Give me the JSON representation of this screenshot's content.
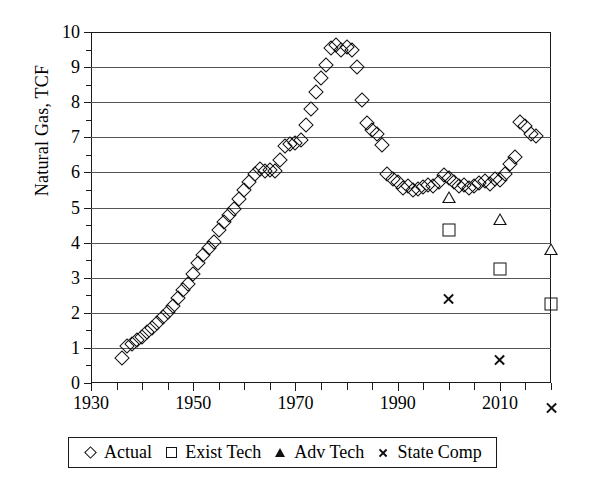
{
  "chart_data": {
    "type": "scatter",
    "title": "",
    "xlabel": "",
    "ylabel": "Natural Gas, TCF",
    "xlim": [
      1930,
      2020
    ],
    "ylim": [
      0,
      10
    ],
    "grid": true,
    "x_tick_step": 5,
    "x_label_step": 20,
    "y_tick_step": 0.5,
    "y_label_step": 1,
    "x_ticklabels": [
      "1930",
      "1950",
      "1970",
      "1990",
      "2010"
    ],
    "y_ticklabels": [
      "0",
      "1",
      "2",
      "3",
      "4",
      "5",
      "6",
      "7",
      "8",
      "9",
      "10"
    ],
    "legend_position": "below-axes",
    "series": [
      {
        "name": "Actual",
        "marker": "diamond",
        "points": [
          [
            1936,
            0.72
          ],
          [
            1937,
            1.05
          ],
          [
            1938,
            1.12
          ],
          [
            1939,
            1.22
          ],
          [
            1940,
            1.3
          ],
          [
            1941,
            1.45
          ],
          [
            1942,
            1.58
          ],
          [
            1943,
            1.72
          ],
          [
            1944,
            1.88
          ],
          [
            1945,
            2.02
          ],
          [
            1946,
            2.18
          ],
          [
            1947,
            2.42
          ],
          [
            1948,
            2.65
          ],
          [
            1949,
            2.82
          ],
          [
            1950,
            3.1
          ],
          [
            1951,
            3.42
          ],
          [
            1952,
            3.65
          ],
          [
            1953,
            3.85
          ],
          [
            1954,
            4.02
          ],
          [
            1955,
            4.35
          ],
          [
            1956,
            4.6
          ],
          [
            1957,
            4.78
          ],
          [
            1958,
            4.95
          ],
          [
            1959,
            5.25
          ],
          [
            1960,
            5.5
          ],
          [
            1961,
            5.72
          ],
          [
            1962,
            5.95
          ],
          [
            1963,
            6.1
          ],
          [
            1964,
            6.05
          ],
          [
            1965,
            6.08
          ],
          [
            1966,
            6.05
          ],
          [
            1967,
            6.35
          ],
          [
            1968,
            6.75
          ],
          [
            1969,
            6.8
          ],
          [
            1970,
            6.85
          ],
          [
            1971,
            6.92
          ],
          [
            1972,
            7.35
          ],
          [
            1973,
            7.8
          ],
          [
            1974,
            8.3
          ],
          [
            1975,
            8.7
          ],
          [
            1976,
            9.05
          ],
          [
            1977,
            9.55
          ],
          [
            1978,
            9.62
          ],
          [
            1979,
            9.48
          ],
          [
            1980,
            9.58
          ],
          [
            1981,
            9.5
          ],
          [
            1982,
            9.0
          ],
          [
            1983,
            8.05
          ],
          [
            1984,
            7.4
          ],
          [
            1985,
            7.22
          ],
          [
            1986,
            7.1
          ],
          [
            1987,
            6.78
          ],
          [
            1988,
            5.95
          ],
          [
            1989,
            5.8
          ],
          [
            1990,
            5.72
          ],
          [
            1991,
            5.55
          ],
          [
            1992,
            5.6
          ],
          [
            1993,
            5.5
          ],
          [
            1994,
            5.52
          ],
          [
            1995,
            5.58
          ],
          [
            1996,
            5.65
          ],
          [
            1997,
            5.62
          ],
          [
            1998,
            5.72
          ],
          [
            1999,
            5.92
          ],
          [
            2000,
            5.85
          ],
          [
            2001,
            5.72
          ],
          [
            2002,
            5.6
          ],
          [
            2003,
            5.65
          ],
          [
            2004,
            5.55
          ],
          [
            2005,
            5.6
          ],
          [
            2006,
            5.7
          ],
          [
            2007,
            5.75
          ],
          [
            2008,
            5.68
          ],
          [
            2009,
            5.8
          ],
          [
            2010,
            5.78
          ],
          [
            2011,
            5.95
          ],
          [
            2012,
            6.25
          ],
          [
            2013,
            6.45
          ],
          [
            2014,
            7.45
          ],
          [
            2015,
            7.32
          ],
          [
            2016,
            7.1
          ],
          [
            2017,
            7.05
          ]
        ]
      },
      {
        "name": "Exist Tech",
        "marker": "square",
        "points": [
          [
            2000,
            4.35
          ],
          [
            2010,
            3.25
          ],
          [
            2020,
            2.25
          ]
        ]
      },
      {
        "name": "Adv Tech",
        "marker": "triangle",
        "points": [
          [
            2000,
            5.3
          ],
          [
            2010,
            5.02
          ],
          [
            2020,
            4.5
          ]
        ]
      },
      {
        "name": "State Comp",
        "marker": "x",
        "points": [
          [
            2000,
            3.42
          ],
          [
            2010,
            2.05
          ],
          [
            2020,
            1.05
          ]
        ]
      }
    ]
  },
  "legend": {
    "items": [
      {
        "label": "Actual",
        "marker": "diamond-icon"
      },
      {
        "label": "Exist Tech",
        "marker": "square-icon"
      },
      {
        "label": "Adv Tech",
        "marker": "triangle-icon"
      },
      {
        "label": "State Comp",
        "marker": "x-icon"
      }
    ]
  },
  "colors": {
    "ink": "#111111",
    "grid": "#555555",
    "background": "#ffffff"
  }
}
